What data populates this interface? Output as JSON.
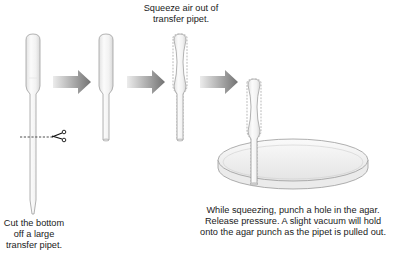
{
  "diagram": {
    "steps": [
      {
        "id": "cut",
        "caption_lines": [
          "Cut the bottom",
          "off a large",
          "transfer pipet."
        ],
        "icon": "scissors-icon"
      },
      {
        "id": "cut-pipet",
        "caption_lines": []
      },
      {
        "id": "squeeze",
        "caption_lines": [
          "Squeeze air out of",
          "transfer pipet."
        ]
      },
      {
        "id": "punch",
        "caption_lines": [
          "While squeezing, punch a hole in the agar.",
          "Release pressure. A slight vacuum will hold",
          "onto the agar punch as the pipet is pulled out."
        ]
      }
    ],
    "arrows": 3,
    "colors": {
      "arrow_dark": "#7a7a7a",
      "arrow_light": "#e6e6e6",
      "pipet_fill": "#f1f1f1",
      "pipet_outline": "#9a9a9a",
      "dish_outline": "#9a9a9a",
      "text": "#1a1a1a"
    }
  }
}
